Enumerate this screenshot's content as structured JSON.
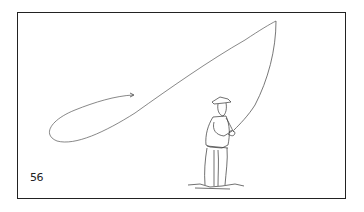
{
  "figure": {
    "number": "56",
    "colors": {
      "ink": "#222222",
      "line": "#555555",
      "background": "#ffffff"
    }
  }
}
